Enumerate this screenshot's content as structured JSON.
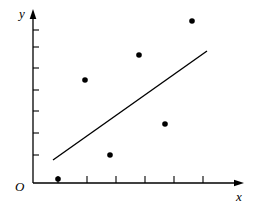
{
  "figure": {
    "background_color": "#ffffff",
    "ink_color": "#000000",
    "width": 258,
    "height": 210
  },
  "labels": {
    "y_axis": "y",
    "x_axis": "x",
    "origin": "O"
  },
  "chart_data": {
    "type": "scatter",
    "title": "",
    "xlabel": "x",
    "ylabel": "y",
    "grid": false,
    "legend": null,
    "origin_label": "O",
    "xlim": [
      0,
      7
    ],
    "ylim": [
      0,
      8
    ],
    "x_ticks": [
      1,
      2,
      3,
      4,
      5,
      6
    ],
    "y_ticks": [
      1,
      2,
      3,
      4,
      5,
      6,
      7
    ],
    "x_tick_labels": [
      "",
      "",
      "",
      "",
      "",
      ""
    ],
    "y_tick_labels": [
      "",
      "",
      "",
      "",
      "",
      "",
      ""
    ],
    "points": [
      {
        "x": 1.0,
        "y": 0.1
      },
      {
        "x": 1.9,
        "y": 4.6
      },
      {
        "x": 2.8,
        "y": 1.4
      },
      {
        "x": 4.0,
        "y": 6.0
      },
      {
        "x": 5.0,
        "y": 2.6
      },
      {
        "x": 5.9,
        "y": 7.3
      }
    ],
    "series": [
      {
        "name": "observations",
        "marker": "filled-circle",
        "color": "#000000",
        "x": [
          1.0,
          1.9,
          2.8,
          4.0,
          5.0,
          5.9
        ],
        "values": [
          0.1,
          4.6,
          1.4,
          6.0,
          2.6,
          7.3
        ]
      }
    ],
    "trend_line": {
      "name": "fitted-line",
      "color": "#000000",
      "x_start": 0.85,
      "y_start": 1.05,
      "x_end": 6.45,
      "y_end": 6.22
    }
  },
  "geometry": {
    "axis": {
      "origin_px": {
        "x": 33,
        "y": 183
      },
      "x_axis_end_px": {
        "x": 243,
        "y": 183
      },
      "y_axis_top_px": {
        "x": 33,
        "y": 12
      }
    },
    "y_tick_px": [
      155,
      133,
      111,
      90,
      68,
      47,
      30
    ],
    "x_tick_px": [
      58,
      87,
      116,
      145,
      174,
      203
    ],
    "points_px": [
      {
        "x": 58,
        "y": 179
      },
      {
        "x": 85,
        "y": 80
      },
      {
        "x": 110,
        "y": 155
      },
      {
        "x": 139,
        "y": 55
      },
      {
        "x": 165,
        "y": 124
      },
      {
        "x": 192,
        "y": 21
      }
    ],
    "line_px": {
      "x1": 53,
      "y1": 160,
      "x2": 207,
      "y2": 51
    }
  }
}
